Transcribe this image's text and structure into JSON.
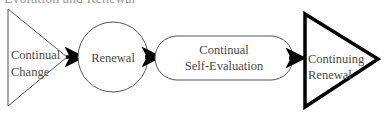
{
  "diagram": {
    "title_cropped": "Evolution and Renewal",
    "nodes": [
      {
        "id": "continual-change",
        "shape": "triangle",
        "lines": [
          "Continual",
          "Change"
        ],
        "stroke": "#555555",
        "stroke_width": 1
      },
      {
        "id": "renewal",
        "shape": "circle",
        "lines": [
          "Renewal"
        ],
        "stroke": "#555555",
        "stroke_width": 1
      },
      {
        "id": "continual-self-evaluation",
        "shape": "rounded-rect",
        "lines": [
          "Continual",
          "Self-Evaluation"
        ],
        "stroke": "#555555",
        "stroke_width": 1
      },
      {
        "id": "continuing-renewal",
        "shape": "triangle",
        "lines": [
          "Continuing",
          "Renewal"
        ],
        "stroke": "#000000",
        "stroke_width": 4
      }
    ],
    "edges": [
      {
        "from": "continual-change",
        "to": "renewal"
      },
      {
        "from": "renewal",
        "to": "continual-self-evaluation"
      },
      {
        "from": "continual-self-evaluation",
        "to": "continuing-renewal"
      }
    ],
    "colors": {
      "text": "#4a4a4a",
      "arrow": "#000000",
      "thin_stroke": "#555555",
      "bold_stroke": "#000000"
    }
  }
}
